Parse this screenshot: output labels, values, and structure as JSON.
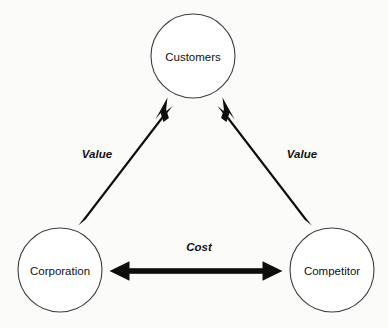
{
  "diagram": {
    "background_color": "#fbfbfa",
    "node_fill": "#ffffff",
    "node_stroke": "#3d3d3d",
    "edge_color": "#0d0d0d",
    "text_color": "#111111",
    "nodes": [
      {
        "id": "customers",
        "label": "Customers",
        "cx": 193,
        "cy": 56,
        "r": 42
      },
      {
        "id": "corporation",
        "label": "Corporation",
        "cx": 60,
        "cy": 270,
        "r": 42
      },
      {
        "id": "competitor",
        "label": "Competitor",
        "cx": 332,
        "cy": 270,
        "r": 42
      }
    ],
    "edges": [
      {
        "id": "corporation-to-customers",
        "label": "Value",
        "from": "corporation",
        "to": "customers",
        "direction": "single",
        "label_x": 97,
        "label_y": 154
      },
      {
        "id": "competitor-to-customers",
        "label": "Value",
        "from": "competitor",
        "to": "customers",
        "direction": "single",
        "label_x": 302,
        "label_y": 154
      },
      {
        "id": "corporation-competitor-cost",
        "label": "Cost",
        "from": "corporation",
        "to": "competitor",
        "direction": "double",
        "label_x": 199,
        "label_y": 247
      }
    ]
  }
}
